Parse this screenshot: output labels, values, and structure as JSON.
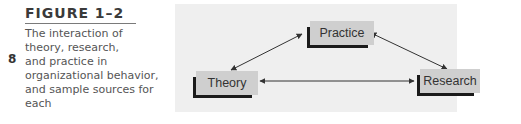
{
  "page_number": "8",
  "figure": {
    "title": "FIGURE 1–2",
    "caption_lines": [
      "The interaction of",
      "theory, research,",
      "and practice in",
      "organizational behavior,",
      "and sample sources for",
      "each"
    ]
  },
  "diagram": {
    "nodes": {
      "practice": "Practice",
      "theory": "Theory",
      "research": "Research"
    },
    "edges": [
      {
        "from": "Theory",
        "to": "Practice",
        "bidirectional": true
      },
      {
        "from": "Theory",
        "to": "Research",
        "bidirectional": true
      },
      {
        "from": "Practice",
        "to": "Research",
        "bidirectional": true
      }
    ],
    "colors": {
      "background": "#efefef",
      "box": "#cfcfcf",
      "shadow": "#1a1a1a"
    }
  }
}
